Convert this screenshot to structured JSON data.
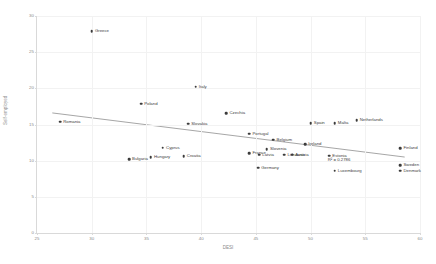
{
  "chart_data": {
    "type": "scatter",
    "title": "",
    "xlabel": "DESI",
    "ylabel": "Self-employed",
    "xlim": [
      25,
      60
    ],
    "ylim": [
      0,
      30
    ],
    "xticks": [
      25,
      30,
      35,
      40,
      45,
      50,
      55,
      60
    ],
    "yticks": [
      0,
      5,
      10,
      15,
      20,
      25,
      30
    ],
    "grid": true,
    "legend": null,
    "annotations": [
      {
        "name": "r-squared",
        "text": "R² = 0.2786",
        "x": 52.6,
        "y": 10.1
      }
    ],
    "trendline": {
      "type": "linear",
      "x_start": 26.4,
      "y_start": 16.6,
      "x_end": 58.6,
      "y_end": 10.5
    },
    "points": [
      {
        "label": "Greece",
        "x": 30.0,
        "y": 27.9
      },
      {
        "label": "Italy",
        "x": 39.5,
        "y": 20.2
      },
      {
        "label": "Poland",
        "x": 34.5,
        "y": 17.9
      },
      {
        "label": "Czechia",
        "x": 42.3,
        "y": 16.6
      },
      {
        "label": "Romania",
        "x": 27.1,
        "y": 15.4
      },
      {
        "label": "Slovakia",
        "x": 38.8,
        "y": 15.1
      },
      {
        "label": "Spain",
        "x": 50.0,
        "y": 15.2
      },
      {
        "label": "Malta",
        "x": 52.2,
        "y": 15.2
      },
      {
        "label": "Netherlands",
        "x": 54.2,
        "y": 15.6
      },
      {
        "label": "Portugal",
        "x": 44.4,
        "y": 13.7
      },
      {
        "label": "Belgium",
        "x": 46.6,
        "y": 12.9
      },
      {
        "label": "Ireland",
        "x": 49.5,
        "y": 12.3
      },
      {
        "label": "Cyprus",
        "x": 36.5,
        "y": 11.8
      },
      {
        "label": "Slovenia",
        "x": 46.0,
        "y": 11.6
      },
      {
        "label": "Finland",
        "x": 58.2,
        "y": 11.7
      },
      {
        "label": "France",
        "x": 44.4,
        "y": 11.0
      },
      {
        "label": "Latvia",
        "x": 45.3,
        "y": 10.8
      },
      {
        "label": "Lithuania",
        "x": 47.6,
        "y": 10.8
      },
      {
        "label": "Austria",
        "x": 48.3,
        "y": 10.8
      },
      {
        "label": "Croatia",
        "x": 38.4,
        "y": 10.6
      },
      {
        "label": "Hungary",
        "x": 35.4,
        "y": 10.5
      },
      {
        "label": "Bulgaria",
        "x": 33.4,
        "y": 10.2
      },
      {
        "label": "Estonia",
        "x": 51.7,
        "y": 10.7
      },
      {
        "label": "Sweden",
        "x": 58.2,
        "y": 9.4
      },
      {
        "label": "Germany",
        "x": 45.2,
        "y": 9.0
      },
      {
        "label": "Luxembourg",
        "x": 52.2,
        "y": 8.6
      },
      {
        "label": "Denmark",
        "x": 58.2,
        "y": 8.6
      }
    ]
  }
}
